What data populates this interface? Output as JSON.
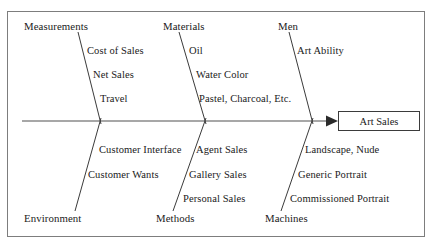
{
  "diagram": {
    "type": "fishbone-ishikawa",
    "effect": {
      "label": "Art Sales"
    },
    "spine": {
      "color": "#8a8a8a",
      "arrow_color": "#2b2b2b"
    },
    "frame_color": "#7d7d7d",
    "text_color": "#1a1a1a",
    "categories": [
      {
        "name": "Measurements",
        "side": "top",
        "causes": [
          "Cost of Sales",
          "Net Sales",
          "Travel"
        ]
      },
      {
        "name": "Materials",
        "side": "top",
        "causes": [
          "Oil",
          "Water Color",
          "Pastel, Charcoal, Etc."
        ]
      },
      {
        "name": "Men",
        "side": "top",
        "causes": [
          "Art Ability"
        ]
      },
      {
        "name": "Environment",
        "side": "bottom",
        "causes": [
          "Customer Interface",
          "Customer Wants"
        ]
      },
      {
        "name": "Methods",
        "side": "bottom",
        "causes": [
          "Agent Sales",
          "Gallery Sales",
          "Personal Sales"
        ]
      },
      {
        "name": "Machines",
        "side": "bottom",
        "causes": [
          "Landscape, Nude",
          "Generic Portrait",
          "Commissioned Portrait"
        ]
      }
    ]
  }
}
